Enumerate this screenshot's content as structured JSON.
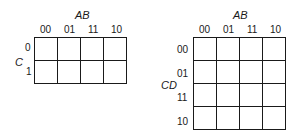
{
  "kmap3": {
    "col_var": "AB",
    "row_var": "C",
    "col_labels": [
      "00",
      "01",
      "11",
      "10"
    ],
    "row_labels": [
      "0",
      "1"
    ]
  },
  "kmap4": {
    "col_var": "AB",
    "row_var": "CD",
    "col_labels": [
      "00",
      "01",
      "11",
      "10"
    ],
    "row_labels": [
      "00",
      "01",
      "11",
      "10"
    ]
  }
}
